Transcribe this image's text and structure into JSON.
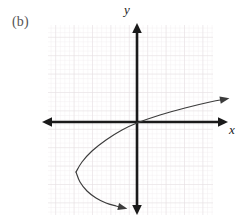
{
  "figure": {
    "panel_label": "(b)",
    "width": 244,
    "height": 223,
    "background_color": "#ffffff"
  },
  "axes": {
    "x_label": "x",
    "y_label": "y",
    "axis_color": "#1a1a1a",
    "x_axis": {
      "y_pixel": 122,
      "x_start": 42,
      "x_end": 228,
      "arrow_left": true,
      "arrow_right": true
    },
    "y_axis": {
      "x_pixel": 137,
      "y_start": 23,
      "y_end": 215,
      "arrow_up": true,
      "arrow_down": true
    }
  },
  "grid": {
    "color_minor": "#f2eef0",
    "color_major": "#e6dfe2",
    "minor_step": 4.6,
    "major_step": 18.4,
    "left": 48,
    "right": 213,
    "top": 25,
    "bottom": 215,
    "visible": true
  },
  "chart_data": {
    "type": "line",
    "title": "",
    "subtitle": "",
    "xlabel": "x",
    "ylabel": "y",
    "grid": true,
    "legend": "none",
    "curve_name": "sideways-parabola-opening-right",
    "curve_color": "#3c3c3c",
    "vertex_pixel": [
      76,
      172
    ],
    "origin_pixel": [
      137,
      122
    ],
    "units_per_major_division": 1,
    "series": [
      {
        "name": "upper-branch",
        "points": [
          [
            76,
            172
          ],
          [
            82,
            162
          ],
          [
            92,
            151
          ],
          [
            106,
            140
          ],
          [
            122,
            130
          ],
          [
            137,
            123
          ],
          [
            160,
            115
          ],
          [
            185,
            108
          ],
          [
            210,
            102
          ],
          [
            226,
            99
          ]
        ],
        "arrow_end": true
      },
      {
        "name": "lower-branch",
        "points": [
          [
            76,
            172
          ],
          [
            80,
            182
          ],
          [
            87,
            191
          ],
          [
            96,
            198
          ],
          [
            106,
            203
          ],
          [
            116,
            206
          ],
          [
            124,
            208
          ]
        ],
        "arrow_end": true
      }
    ],
    "annotations": [
      {
        "text": "(b)",
        "position": "top-left"
      },
      {
        "text": "y",
        "position": "y-axis-top"
      },
      {
        "text": "x",
        "position": "x-axis-right"
      }
    ]
  }
}
